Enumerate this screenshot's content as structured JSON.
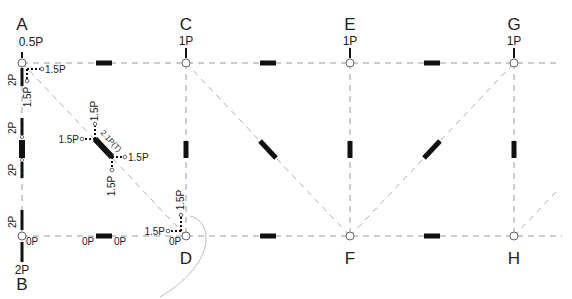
{
  "diagram": {
    "type": "truss-method-of-joints",
    "nodes": {
      "A": {
        "label": "A",
        "load": "0.5P"
      },
      "B": {
        "label": "B",
        "reaction": "2P"
      },
      "C": {
        "label": "C",
        "load": "1P"
      },
      "D": {
        "label": "D"
      },
      "E": {
        "label": "E",
        "load": "1P"
      },
      "F": {
        "label": "F"
      },
      "G": {
        "label": "G",
        "load": "1P"
      },
      "H": {
        "label": "H"
      }
    },
    "member_forces": {
      "AB_upper": "2P",
      "AB_mid_top": "2P",
      "AB_mid_bottom": "2P",
      "AB_lower": "2P",
      "A_horizontal_component": "1.5P",
      "A_vertical_component": "1.5P",
      "AD_diagonal": "2.1P(T)",
      "AD_upper_horizontal": "1.5P",
      "AD_upper_vertical": "1.5P",
      "AD_lower_horizontal": "1.5P",
      "AD_lower_vertical": "1.5P",
      "D_horizontal_component": "1.5P",
      "D_vertical_component": "1.5P",
      "B_bottom_chord": "0P",
      "BD_left": "0P",
      "BD_right": "0P",
      "D_bottom_chord": "0P"
    }
  }
}
